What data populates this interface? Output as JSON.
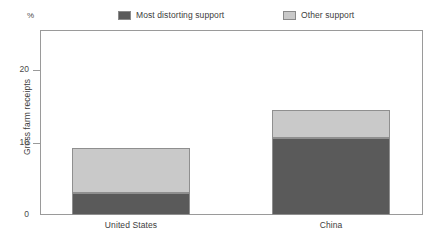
{
  "chart_data": {
    "type": "bar",
    "subtype": "stacked-vertical",
    "title": "",
    "xlabel": "",
    "ylabel": "Gross farm receipts",
    "unit_label": "%",
    "categories": [
      "United States",
      "China"
    ],
    "series": [
      {
        "name": "Most distorting support",
        "color": "#5a5a5a",
        "values": [
          3.0,
          10.7
        ]
      },
      {
        "name": "Other support",
        "color": "#c9c9c9",
        "values": [
          6.3,
          3.8
        ]
      }
    ],
    "totals": [
      9.3,
      14.5
    ],
    "ylim": [
      0,
      25.6
    ],
    "yticks": [
      0,
      10,
      20
    ],
    "ytick_labels": [
      "0",
      "10",
      "20"
    ],
    "grid": false,
    "legend_position": "top"
  },
  "legend": {
    "items": [
      {
        "label": "Most distorting support",
        "color": "#5a5a5a"
      },
      {
        "label": "Other support",
        "color": "#c9c9c9"
      }
    ]
  },
  "axes": {
    "unit": "%",
    "y_title": "Gross farm receipts",
    "y_ticks": [
      "20",
      "10",
      "0"
    ],
    "x_ticks": [
      "United States",
      "China"
    ]
  }
}
